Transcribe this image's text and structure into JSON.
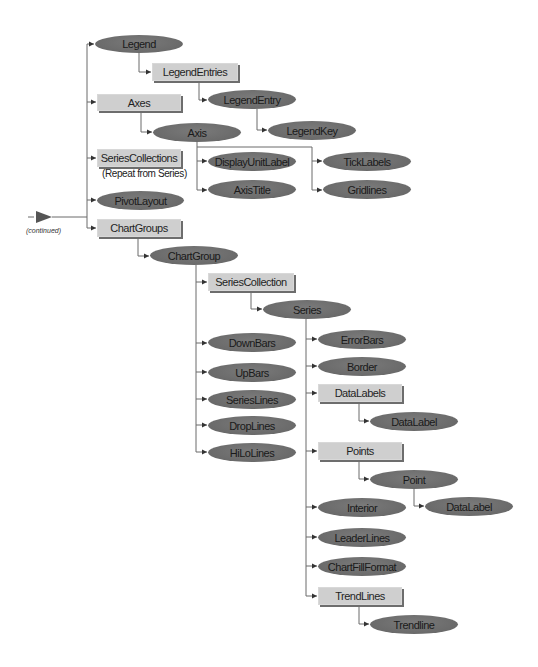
{
  "diagram": {
    "continued_label": "(continued)",
    "repeat_note": "(Repeat from Series)",
    "colors": {
      "object_ellipse": "#6e6e6e",
      "collection_box": "#cfcfcf",
      "box_shadow": "#6d6d6d",
      "connector": "#6b6b6b"
    },
    "legend": {
      "object": "Object (ellipse)",
      "collection": "Collection (box)"
    },
    "nodes": {
      "legend": "Legend",
      "legend_entries": "LegendEntries",
      "legend_entry": "LegendEntry",
      "legend_key": "LegendKey",
      "axes": "Axes",
      "axis": "Axis",
      "display_unit_label": "DisplayUnitLabel",
      "tick_labels": "TickLabels",
      "axis_title": "AxisTitle",
      "gridlines": "Gridlines",
      "series_collections": "SeriesCollections",
      "pivot_layout": "PivotLayout",
      "chart_groups": "ChartGroups",
      "chart_group": "ChartGroup",
      "series_collection": "SeriesCollection",
      "series": "Series",
      "down_bars": "DownBars",
      "up_bars": "UpBars",
      "series_lines": "SeriesLines",
      "drop_lines": "DropLines",
      "hilo_lines": "HiLoLines",
      "error_bars": "ErrorBars",
      "border": "Border",
      "data_labels": "DataLabels",
      "data_label_1": "DataLabel",
      "points": "Points",
      "point": "Point",
      "data_label_2": "DataLabel",
      "interior": "Interior",
      "leader_lines": "LeaderLines",
      "chart_fill_format": "ChartFillFormat",
      "trend_lines": "TrendLines",
      "trendline": "Trendline"
    }
  }
}
